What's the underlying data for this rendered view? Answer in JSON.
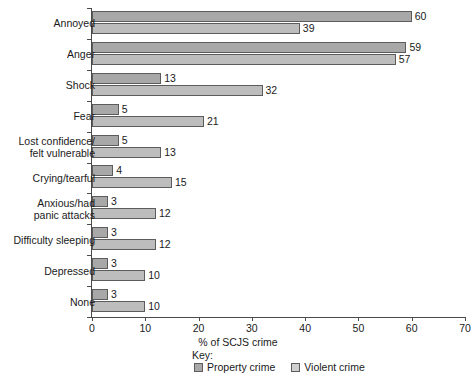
{
  "chart_data": {
    "type": "bar",
    "orientation": "horizontal",
    "title": "",
    "xlabel": "% of SCJS crime",
    "ylabel": "",
    "xlim": [
      0,
      70
    ],
    "xticks": [
      0,
      10,
      20,
      30,
      40,
      50,
      60,
      70
    ],
    "grid": false,
    "legend_position": "bottom",
    "legend_title": "Key:",
    "categories": [
      "Annoyed",
      "Anger",
      "Shock",
      "Fear",
      "Lost confidence/\nfelt vulnerable",
      "Crying/tearful",
      "Anxious/had\npanic attacks",
      "Difficulty sleeping",
      "Depressed",
      "None"
    ],
    "series": [
      {
        "name": "Property crime",
        "color": "#a8a8a8",
        "values": [
          60,
          59,
          13,
          5,
          5,
          4,
          3,
          3,
          3,
          3
        ]
      },
      {
        "name": "Violent crime",
        "color": "#bdbdbd",
        "values": [
          39,
          57,
          32,
          21,
          13,
          15,
          12,
          12,
          10,
          10
        ]
      }
    ]
  }
}
